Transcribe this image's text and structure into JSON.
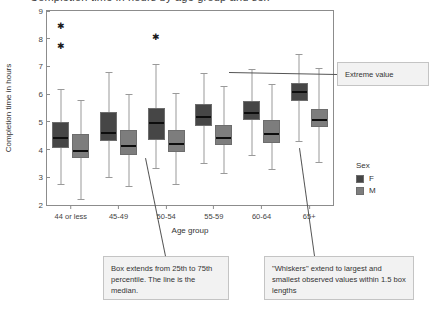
{
  "figure": {
    "clipped_title": "Completion time in hours by age group and sex",
    "ylabel": "Completion time in hours",
    "xlabel": "Age group"
  },
  "legend": {
    "title": "Sex",
    "items": [
      {
        "label": "F",
        "color": "#464646"
      },
      {
        "label": "M",
        "color": "#7d7d7d"
      }
    ]
  },
  "callouts": {
    "extreme": "Extreme value",
    "box": "Box extends from 25th to 75th percentile. The line is the median.",
    "whisker": "\"Whiskers\" extend to largest and smallest observed values within 1.5 box lengths"
  },
  "chart_data": {
    "type": "box",
    "title": "Completion time in hours by age group and sex",
    "xlabel": "Age group",
    "ylabel": "Completion time in hours",
    "ylim": [
      2,
      9
    ],
    "yticks": [
      2,
      3,
      4,
      5,
      6,
      7,
      8,
      9
    ],
    "grid": false,
    "legend_position": "right",
    "categories": [
      "44 or less",
      "45-49",
      "50-54",
      "55-59",
      "60-64",
      "65+"
    ],
    "series": [
      {
        "name": "F",
        "color": "#464646",
        "boxes": [
          {
            "category": "44 or less",
            "whisker_low": 2.75,
            "q1": 4.05,
            "median": 4.45,
            "q3": 5.0,
            "whisker_high": 6.2,
            "outliers": [
              7.75,
              8.45
            ]
          },
          {
            "category": "45-49",
            "whisker_low": 3.0,
            "q1": 4.3,
            "median": 4.65,
            "q3": 5.35,
            "whisker_high": 6.8,
            "outliers": []
          },
          {
            "category": "50-54",
            "whisker_low": 3.35,
            "q1": 4.35,
            "median": 5.0,
            "q3": 5.5,
            "whisker_high": 7.1,
            "outliers": [
              8.05
            ]
          },
          {
            "category": "55-59",
            "whisker_low": 3.5,
            "q1": 4.85,
            "median": 5.2,
            "q3": 5.65,
            "whisker_high": 6.75,
            "outliers": []
          },
          {
            "category": "60-64",
            "whisker_low": 3.8,
            "q1": 5.05,
            "median": 5.35,
            "q3": 5.75,
            "whisker_high": 6.9,
            "outliers": []
          },
          {
            "category": "65+",
            "whisker_low": 4.3,
            "q1": 5.75,
            "median": 6.1,
            "q3": 6.4,
            "whisker_high": 7.45,
            "outliers": []
          }
        ]
      },
      {
        "name": "M",
        "color": "#7d7d7d",
        "boxes": [
          {
            "category": "44 or less",
            "whisker_low": 2.2,
            "q1": 3.7,
            "median": 4.0,
            "q3": 4.55,
            "whisker_high": 5.8,
            "outliers": []
          },
          {
            "category": "45-49",
            "whisker_low": 2.7,
            "q1": 3.8,
            "median": 4.15,
            "q3": 4.7,
            "whisker_high": 6.0,
            "outliers": []
          },
          {
            "category": "50-54",
            "whisker_low": 2.75,
            "q1": 3.9,
            "median": 4.25,
            "q3": 4.7,
            "whisker_high": 6.05,
            "outliers": []
          },
          {
            "category": "55-59",
            "whisker_low": 3.15,
            "q1": 4.15,
            "median": 4.45,
            "q3": 4.9,
            "whisker_high": 6.3,
            "outliers": []
          },
          {
            "category": "60-64",
            "whisker_low": 3.3,
            "q1": 4.25,
            "median": 4.6,
            "q3": 5.05,
            "whisker_high": 6.35,
            "outliers": []
          },
          {
            "category": "65+",
            "whisker_low": 3.55,
            "q1": 4.8,
            "median": 5.1,
            "q3": 5.45,
            "whisker_high": 6.95,
            "outliers": []
          }
        ]
      }
    ]
  }
}
